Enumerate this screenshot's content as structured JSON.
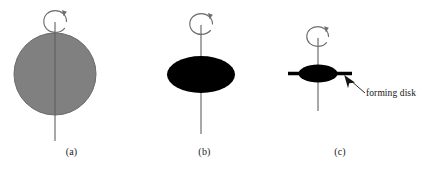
{
  "figure": {
    "width": 430,
    "height": 170,
    "background": "#ffffff"
  },
  "panels": [
    {
      "id": "a",
      "label": "(a)",
      "body_shape": "sphere",
      "body_fill": "#808080",
      "body_stroke": "#6b6b6b",
      "axis_color": "#6e6e6e",
      "rotation_arrow": "counterclockwise-spin-arrow"
    },
    {
      "id": "b",
      "label": "(b)",
      "body_shape": "flattened-ellipse",
      "body_fill": "#000000",
      "body_stroke": "#000000",
      "axis_color": "#6e6e6e",
      "rotation_arrow": "counterclockwise-spin-arrow"
    },
    {
      "id": "c",
      "label": "(c)",
      "body_shape": "small-ellipse-with-disk",
      "body_fill": "#000000",
      "body_stroke": "#000000",
      "axis_color": "#6e6e6e",
      "disk_color": "#000000",
      "rotation_arrow": "counterclockwise-spin-arrow"
    }
  ],
  "annotations": {
    "forming_disk": {
      "text": "forming disk",
      "color": "#141414",
      "pointer": "arrow-up-left"
    }
  }
}
